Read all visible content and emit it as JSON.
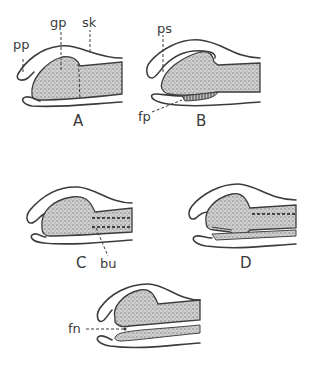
{
  "figure": {
    "panels": [
      {
        "id": "A",
        "label": "A",
        "annotations": [
          "pp",
          "gp",
          "sk"
        ]
      },
      {
        "id": "B",
        "label": "B",
        "annotations": [
          "ps",
          "fp"
        ]
      },
      {
        "id": "C",
        "label": "C",
        "annotations": [
          "bu"
        ]
      },
      {
        "id": "D",
        "label": "D",
        "annotations": []
      },
      {
        "id": "E",
        "label": "",
        "annotations": [
          "fn"
        ]
      }
    ],
    "labels": {
      "pp": "pp",
      "gp": "gp",
      "sk": "sk",
      "ps": "ps",
      "fp": "fp",
      "bu": "bu",
      "fn": "fn",
      "A": "A",
      "B": "B",
      "C": "C",
      "D": "D"
    },
    "colors": {
      "ink": "#3c3c3c",
      "stipple": "#8a8a8a",
      "background": "#ffffff"
    }
  }
}
